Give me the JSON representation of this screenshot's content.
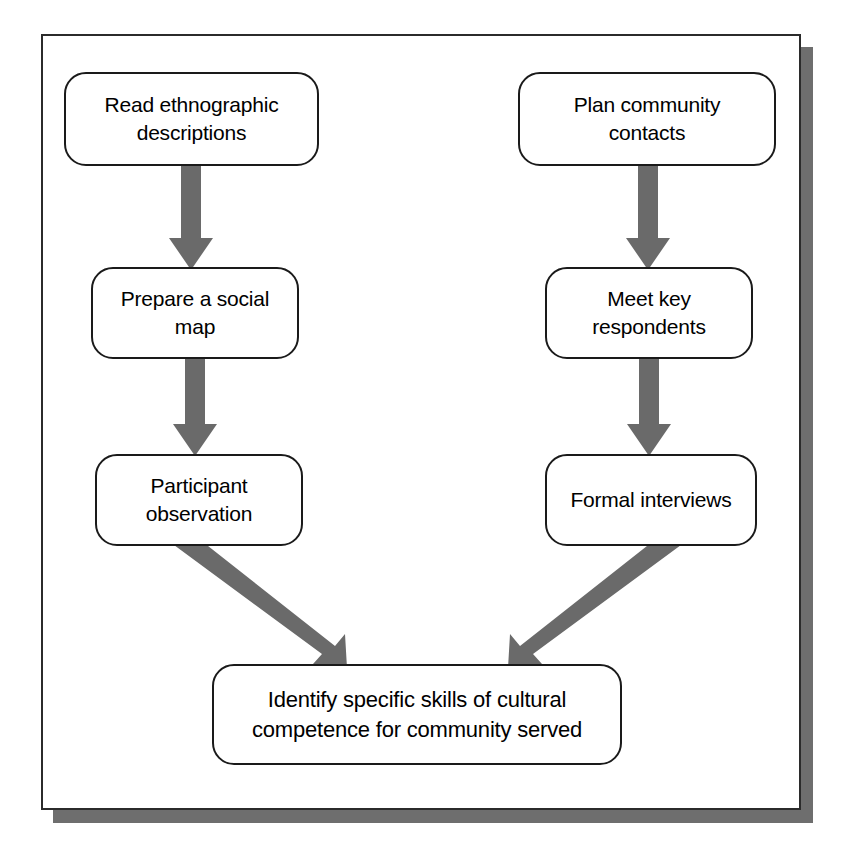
{
  "diagram": {
    "type": "flowchart",
    "arrow_color": "#6a6a6a",
    "node_border_color": "#1a1a1a",
    "frame_color": "#2b2b2b",
    "background_color": "#ffffff",
    "nodes": [
      {
        "id": "read",
        "label": "Read ethnographic\ndescriptions",
        "column": "left",
        "row": 1
      },
      {
        "id": "plan",
        "label": "Plan community\ncontacts",
        "column": "right",
        "row": 1
      },
      {
        "id": "map",
        "label": "Prepare a social\nmap",
        "column": "left",
        "row": 2
      },
      {
        "id": "meet",
        "label": "Meet key\nrespondents",
        "column": "right",
        "row": 2
      },
      {
        "id": "participant",
        "label": "Participant\nobservation",
        "column": "left",
        "row": 3
      },
      {
        "id": "formal",
        "label": "Formal interviews",
        "column": "right",
        "row": 3
      },
      {
        "id": "identify",
        "label": "Identify specific skills of cultural\ncompetence for community served",
        "column": "center",
        "row": 4
      }
    ],
    "edges": [
      {
        "from": "read",
        "to": "map",
        "style": "vertical-arrow-down"
      },
      {
        "from": "plan",
        "to": "meet",
        "style": "vertical-arrow-down"
      },
      {
        "from": "map",
        "to": "participant",
        "style": "vertical-arrow-down"
      },
      {
        "from": "meet",
        "to": "formal",
        "style": "vertical-arrow-down"
      },
      {
        "from": "participant",
        "to": "identify",
        "style": "diagonal-arrow-down-right"
      },
      {
        "from": "formal",
        "to": "identify",
        "style": "diagonal-arrow-down-left"
      }
    ]
  }
}
